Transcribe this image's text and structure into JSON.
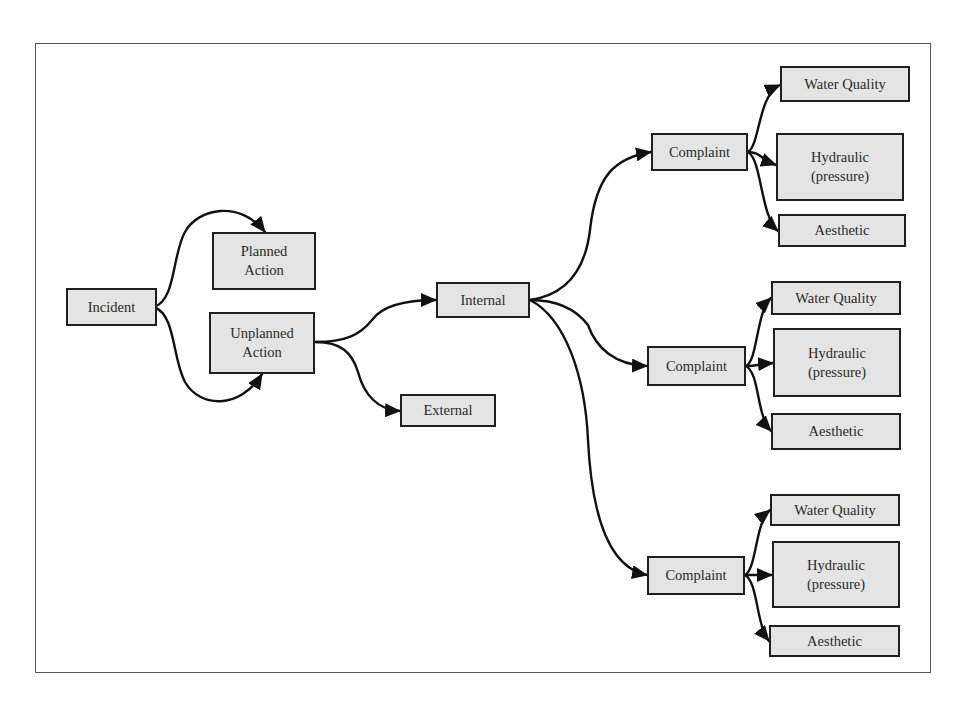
{
  "diagram": {
    "type": "flow-tree",
    "colors": {
      "box_fill": "#e4e4e4",
      "box_border": "#1f1f1f",
      "line": "#111111",
      "frame": "#555555"
    },
    "nodes": {
      "incident": {
        "label": "Incident"
      },
      "planned_action": {
        "label": "Planned\nAction"
      },
      "unplanned_action": {
        "label": "Unplanned\nAction"
      },
      "internal": {
        "label": "Internal"
      },
      "external": {
        "label": "External"
      },
      "complaint_1": {
        "label": "Complaint"
      },
      "water_quality_1": {
        "label": "Water Quality"
      },
      "hydraulic_1": {
        "label": "Hydraulic\n(pressure)"
      },
      "aesthetic_1": {
        "label": "Aesthetic"
      },
      "complaint_2": {
        "label": "Complaint"
      },
      "water_quality_2": {
        "label": "Water Quality"
      },
      "hydraulic_2": {
        "label": "Hydraulic\n(pressure)"
      },
      "aesthetic_2": {
        "label": "Aesthetic"
      },
      "complaint_3": {
        "label": "Complaint"
      },
      "water_quality_3": {
        "label": "Water Quality"
      },
      "hydraulic_3": {
        "label": "Hydraulic\n(pressure)"
      },
      "aesthetic_3": {
        "label": "Aesthetic"
      }
    },
    "edges": [
      [
        "incident",
        "planned_action"
      ],
      [
        "incident",
        "unplanned_action"
      ],
      [
        "unplanned_action",
        "internal"
      ],
      [
        "unplanned_action",
        "external"
      ],
      [
        "internal",
        "complaint_1"
      ],
      [
        "internal",
        "complaint_2"
      ],
      [
        "internal",
        "complaint_3"
      ],
      [
        "complaint_1",
        "water_quality_1"
      ],
      [
        "complaint_1",
        "hydraulic_1"
      ],
      [
        "complaint_1",
        "aesthetic_1"
      ],
      [
        "complaint_2",
        "water_quality_2"
      ],
      [
        "complaint_2",
        "hydraulic_2"
      ],
      [
        "complaint_2",
        "aesthetic_2"
      ],
      [
        "complaint_3",
        "water_quality_3"
      ],
      [
        "complaint_3",
        "hydraulic_3"
      ],
      [
        "complaint_3",
        "aesthetic_3"
      ]
    ]
  }
}
